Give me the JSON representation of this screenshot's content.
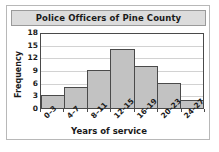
{
  "chart_data": {
    "type": "bar",
    "title": "Police Officers of Pine County",
    "xlabel": "Years of service",
    "ylabel": "Frequency",
    "categories": [
      "0–3",
      "4–7",
      "8–11",
      "12–15",
      "16–19",
      "20–23",
      "24–27"
    ],
    "values": [
      3,
      5,
      9,
      14,
      10,
      6,
      2
    ],
    "ylim": [
      0,
      18
    ],
    "yticks": [
      0,
      3,
      6,
      9,
      12,
      15,
      18
    ],
    "ytick_labels": [
      "0",
      "3",
      "6",
      "9",
      "12",
      "15",
      "18"
    ],
    "grid": true,
    "legend": false,
    "bar_fill_color": "#c2c2c2",
    "bar_edge_color": "#4a4a4a",
    "gridline_color": "#d2d2d2",
    "title_banner_color": "#dcdcdc",
    "frame_color": "#b8b8b8"
  }
}
